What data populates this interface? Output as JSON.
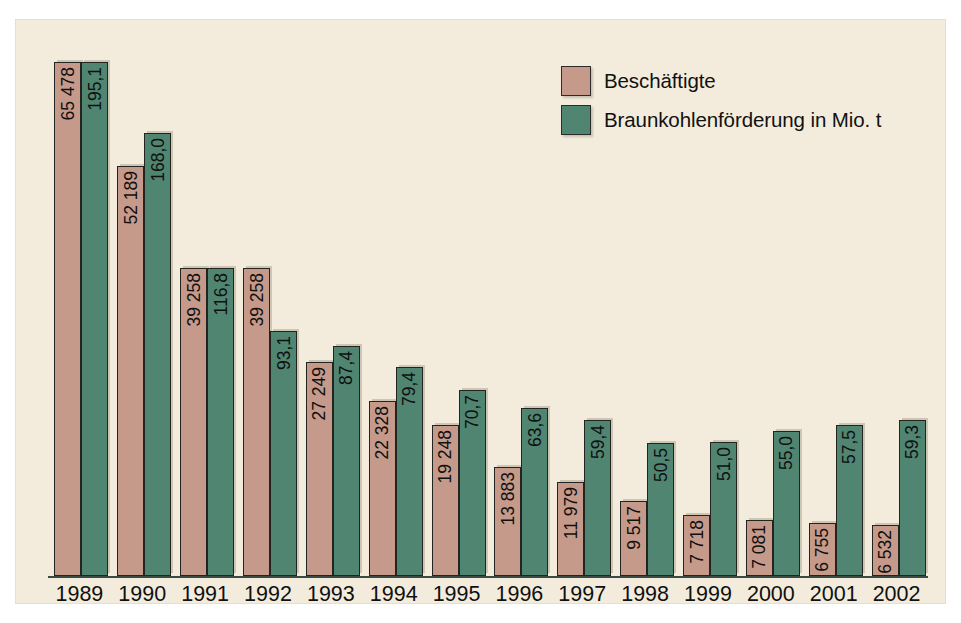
{
  "figure": {
    "background_color": "#f3ecdc",
    "page_color": "#ffffff"
  },
  "legend": {
    "position": "top-right",
    "items": [
      {
        "label": "Beschäftigte",
        "color": "#c59a8a",
        "swatch_name": "legend-swatch-employees"
      },
      {
        "label": "Braunkohlenförderung in Mio. t",
        "color": "#4f8571",
        "swatch_name": "legend-swatch-production"
      }
    ]
  },
  "chart_data": {
    "type": "bar",
    "title": "",
    "subtitle": "",
    "xlabel": "",
    "ylabel": "",
    "grid": false,
    "legend_position": "top-right",
    "axis_line": true,
    "categories": [
      "1989",
      "1990",
      "1991",
      "1992",
      "1993",
      "1994",
      "1995",
      "1996",
      "1997",
      "1998",
      "1999",
      "2000",
      "2001",
      "2002"
    ],
    "series": [
      {
        "name": "Beschäftigte",
        "color": "#c59a8a",
        "unit": "Personen",
        "values": [
          65478,
          52189,
          39258,
          39258,
          27249,
          22328,
          19248,
          13883,
          11979,
          9517,
          7718,
          7081,
          6755,
          6532
        ],
        "labels": [
          "65 478",
          "52 189",
          "39 258",
          "39 258",
          "27 249",
          "22 328",
          "19 248",
          "13 883",
          "11 979",
          "9 517",
          "7 718",
          "7 081",
          "6 755",
          "6 532"
        ],
        "ylim": [
          0,
          65478
        ]
      },
      {
        "name": "Braunkohlenförderung in Mio. t",
        "color": "#4f8571",
        "unit": "Mio. t",
        "values": [
          195.1,
          168.0,
          116.8,
          93.1,
          87.4,
          79.4,
          70.7,
          63.6,
          59.4,
          50.5,
          51.0,
          55.0,
          57.5,
          59.3
        ],
        "labels": [
          "195,1",
          "168,0",
          "116,8",
          "93,1",
          "87,4",
          "79,4",
          "70,7",
          "63,6",
          "59,4",
          "50,5",
          "51,0",
          "55,0",
          "57,5",
          "59,3"
        ],
        "ylim": [
          0,
          195.1
        ]
      }
    ]
  }
}
